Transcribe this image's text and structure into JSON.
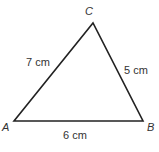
{
  "diagram": {
    "type": "triangle",
    "stroke_color": "#222222",
    "vertices": {
      "A": {
        "label": "A",
        "x": 14,
        "y": 121
      },
      "B": {
        "label": "B",
        "x": 143,
        "y": 121
      },
      "C": {
        "label": "C",
        "x": 93,
        "y": 23
      }
    },
    "sides": {
      "AC": {
        "label": "7 cm"
      },
      "CB": {
        "label": "5 cm"
      },
      "AB": {
        "label": "6 cm"
      }
    }
  }
}
